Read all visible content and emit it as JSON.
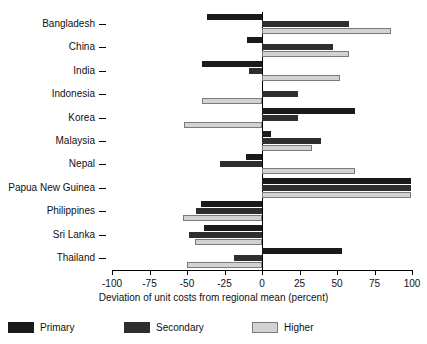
{
  "chart_data": {
    "type": "bar",
    "orientation": "horizontal",
    "title": "",
    "xlabel": "Deviation of unit costs from regional mean (percent)",
    "ylabel": "",
    "xlim": [
      -100,
      100
    ],
    "xticks": [
      -100,
      -75,
      -50,
      -25,
      0,
      25,
      50,
      75,
      100
    ],
    "xtick_labels": [
      "-100",
      "-75",
      "-50",
      "-25",
      "0",
      "25",
      "50",
      "75",
      "100"
    ],
    "grid": false,
    "legend_position": "bottom",
    "categories": [
      "Bangladesh",
      "China",
      "India",
      "Indonesia",
      "Korea",
      "Malaysia",
      "Nepal",
      "Papua New Guinea",
      "Philippines",
      "Sri Lanka",
      "Thailand"
    ],
    "series": [
      {
        "name": "Primary",
        "color": "#1a1a1a",
        "values": [
          -37,
          -10,
          -40,
          0,
          62,
          6,
          -11,
          99,
          -41,
          -39,
          53
        ]
      },
      {
        "name": "Secondary",
        "color": "#2e2e2e",
        "values": [
          58,
          47,
          -9,
          24,
          24,
          39,
          -28,
          99,
          -44,
          -49,
          -19
        ]
      },
      {
        "name": "Higher",
        "color": "#d2d2d2",
        "values": [
          86,
          58,
          52,
          -40,
          -52,
          33,
          62,
          99,
          -53,
          -45,
          -50
        ]
      }
    ]
  },
  "legend": {
    "items": [
      {
        "label": "Primary",
        "key": "primary"
      },
      {
        "label": "Secondary",
        "key": "secondary"
      },
      {
        "label": "Higher",
        "key": "higher"
      }
    ]
  }
}
